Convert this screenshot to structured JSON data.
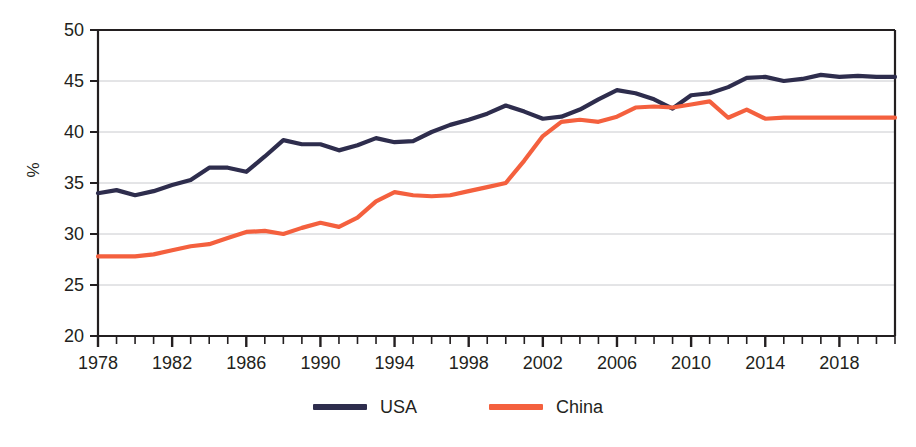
{
  "chart_data": {
    "type": "line",
    "title": "",
    "xlabel": "",
    "ylabel": "%",
    "xlim": [
      1978,
      2021
    ],
    "ylim": [
      20,
      50
    ],
    "yticks": [
      20,
      25,
      30,
      35,
      40,
      45,
      50
    ],
    "ytick_labels": [
      "20",
      "25",
      "30",
      "35",
      "40",
      "45",
      "50"
    ],
    "xticks": [
      1978,
      1982,
      1986,
      1990,
      1994,
      1998,
      2002,
      2006,
      2010,
      2014,
      2018
    ],
    "xtick_labels": [
      "1978",
      "1982",
      "1986",
      "1990",
      "1994",
      "1998",
      "2002",
      "2006",
      "2010",
      "2014",
      "2018"
    ],
    "minor_xtick_interval": 1,
    "grid": "horizontal",
    "legend_position": "bottom-center",
    "x": [
      1978,
      1979,
      1980,
      1981,
      1982,
      1983,
      1984,
      1985,
      1986,
      1987,
      1988,
      1989,
      1990,
      1991,
      1992,
      1993,
      1994,
      1995,
      1996,
      1997,
      1998,
      1999,
      2000,
      2001,
      2002,
      2003,
      2004,
      2005,
      2006,
      2007,
      2008,
      2009,
      2010,
      2011,
      2012,
      2013,
      2014,
      2015,
      2016,
      2017,
      2018,
      2019,
      2020,
      2021
    ],
    "series": [
      {
        "name": "USA",
        "color": "#2e2d4d",
        "values": [
          34.0,
          34.3,
          33.8,
          34.2,
          34.8,
          35.3,
          36.5,
          36.5,
          36.1,
          37.6,
          39.2,
          38.8,
          38.8,
          38.2,
          38.7,
          39.4,
          39.0,
          39.1,
          40.0,
          40.7,
          41.2,
          41.8,
          42.6,
          42.0,
          41.3,
          41.5,
          42.2,
          43.2,
          44.1,
          43.8,
          43.2,
          42.3,
          43.6,
          43.8,
          44.4,
          45.3,
          45.4,
          45.0,
          45.2,
          45.6,
          45.4,
          45.5,
          45.4,
          45.4
        ]
      },
      {
        "name": "China",
        "color": "#f4603e",
        "values": [
          27.8,
          27.8,
          27.8,
          28.0,
          28.4,
          28.8,
          29.0,
          29.6,
          30.2,
          30.3,
          30.0,
          30.6,
          31.1,
          30.7,
          31.6,
          33.2,
          34.1,
          33.8,
          33.7,
          33.8,
          34.2,
          34.6,
          35.0,
          37.2,
          39.6,
          41.0,
          41.2,
          41.0,
          41.5,
          42.4,
          42.5,
          42.4,
          42.7,
          43.0,
          41.4,
          42.2,
          41.3,
          41.4,
          41.4,
          41.4,
          41.4,
          41.4,
          41.4,
          41.4
        ]
      }
    ]
  },
  "axis": {
    "y_title": "%"
  },
  "legend": {
    "items": [
      {
        "label": "USA",
        "color": "#2e2d4d"
      },
      {
        "label": "China",
        "color": "#f4603e"
      }
    ]
  }
}
